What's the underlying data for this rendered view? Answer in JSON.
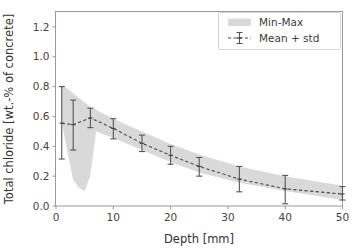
{
  "chart_data": {
    "type": "line",
    "title": "",
    "xlabel": "Depth [mm]",
    "ylabel": "Total chloride [wt.-% of concrete]",
    "xlim": [
      0,
      50
    ],
    "ylim": [
      0.0,
      1.3
    ],
    "xticks": [
      0,
      10,
      20,
      30,
      40,
      50
    ],
    "xtick_labels": [
      "0",
      "10",
      "20",
      "30",
      "40",
      "50"
    ],
    "yticks": [
      0.0,
      0.2,
      0.4,
      0.6,
      0.8,
      1.0,
      1.2
    ],
    "ytick_labels": [
      "0.0",
      "0.2",
      "0.4",
      "0.6",
      "0.8",
      "1.0",
      "1.2"
    ],
    "grid": false,
    "legend_position": "upper right",
    "legend": [
      {
        "label": "Min-Max",
        "type": "band",
        "color": "#d9d9d9"
      },
      {
        "label": "Mean + std",
        "type": "errorbar-dashed-line",
        "color": "#4a4a4a"
      }
    ],
    "x": [
      1,
      3,
      6,
      10,
      15,
      20,
      25,
      32,
      40,
      50
    ],
    "series": [
      {
        "name": "Mean + std",
        "values": [
          0.555,
          0.545,
          0.59,
          0.52,
          0.42,
          0.34,
          0.265,
          0.18,
          0.115,
          0.08
        ],
        "std_upper": [
          0.8,
          0.71,
          0.655,
          0.585,
          0.475,
          0.4,
          0.325,
          0.265,
          0.205,
          0.13
        ],
        "std_lower": [
          0.315,
          0.375,
          0.525,
          0.45,
          0.365,
          0.28,
          0.2,
          0.095,
          0.015,
          0.04
        ]
      }
    ],
    "band": {
      "name": "Min-Max",
      "x": [
        1,
        2,
        3,
        4,
        5,
        6,
        7,
        10,
        15,
        20,
        25,
        32,
        40,
        50
      ],
      "max": [
        0.815,
        0.785,
        0.755,
        0.725,
        0.695,
        0.665,
        0.645,
        0.585,
        0.5,
        0.415,
        0.345,
        0.265,
        0.2,
        0.135
      ],
      "min": [
        0.565,
        0.36,
        0.175,
        0.12,
        0.1,
        0.205,
        0.5,
        0.455,
        0.375,
        0.295,
        0.225,
        0.155,
        0.1,
        0.04
      ]
    }
  },
  "axes": {
    "x_title": "Depth [mm]",
    "y_title": "Total chloride [wt.-% of concrete]"
  },
  "legend": {
    "min_max_label": "Min-Max",
    "mean_std_label": "Mean + std"
  },
  "colors": {
    "band": "#d9d9d9",
    "line": "#4a4a4a",
    "frame": "#9a9a9a",
    "text": "#3a3a3a"
  }
}
